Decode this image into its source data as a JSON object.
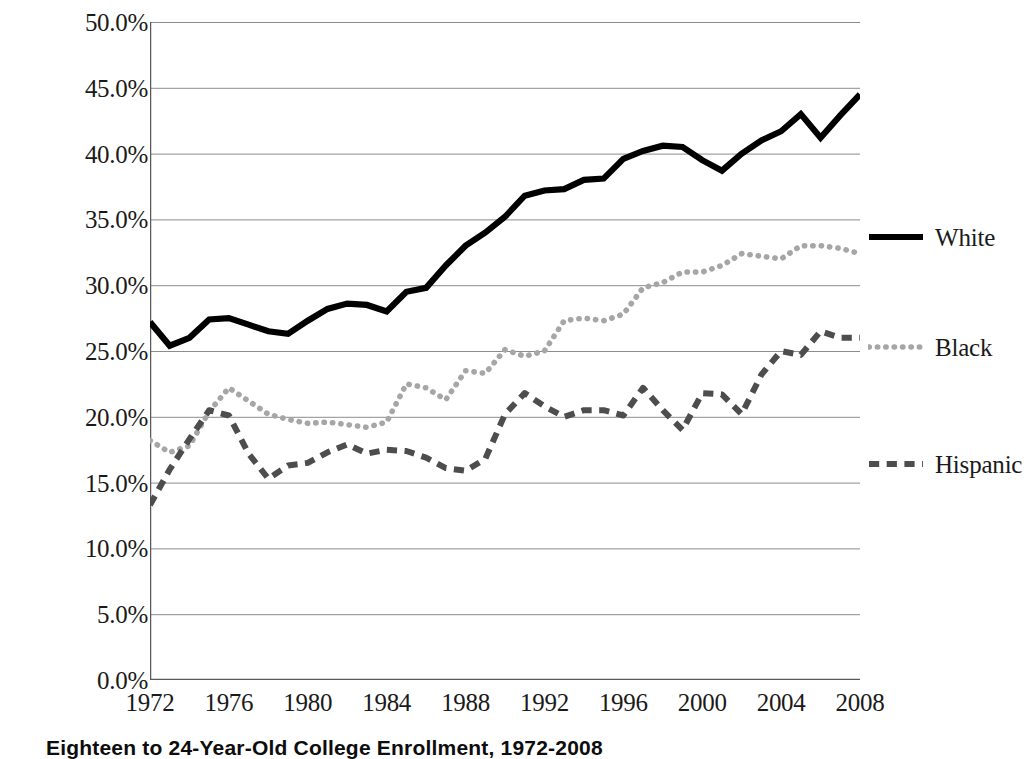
{
  "caption": "Eighteen to 24-Year-Old College Enrollment, 1972-2008",
  "colors": {
    "white_series": "#000000",
    "black_series": "#a6a6a6",
    "hispanic_series": "#4d4d4d",
    "gridline": "#8c8c8c",
    "axis": "#595959",
    "text": "#1a1a1a"
  },
  "legend": {
    "position": "right",
    "entries": [
      {
        "label": "White",
        "style": "solid",
        "color": "#000000",
        "swatch": "solid-line-swatch"
      },
      {
        "label": "Black",
        "style": "dotted",
        "color": "#a6a6a6",
        "swatch": "dotted-line-swatch"
      },
      {
        "label": "Hispanic",
        "style": "dashed",
        "color": "#4d4d4d",
        "swatch": "dashed-line-swatch"
      }
    ]
  },
  "chart_data": {
    "type": "line",
    "title": "Eighteen to 24-Year-Old College Enrollment, 1972-2008",
    "xlabel": "",
    "ylabel": "",
    "xlim": [
      1972,
      2008
    ],
    "ylim": [
      0,
      50
    ],
    "grid": true,
    "y_tick_labels": [
      "0.0%",
      "5.0%",
      "10.0%",
      "15.0%",
      "20.0%",
      "25.0%",
      "30.0%",
      "35.0%",
      "40.0%",
      "45.0%",
      "50.0%"
    ],
    "y_ticks": [
      0,
      5,
      10,
      15,
      20,
      25,
      30,
      35,
      40,
      45,
      50
    ],
    "x_tick_labels": [
      "1972",
      "1976",
      "1980",
      "1984",
      "1988",
      "1992",
      "1996",
      "2000",
      "2004",
      "2008"
    ],
    "x_ticks": [
      1972,
      1976,
      1980,
      1984,
      1988,
      1992,
      1996,
      2000,
      2004,
      2008
    ],
    "x_minor_tick_step": 1,
    "x": [
      1972,
      1973,
      1974,
      1975,
      1976,
      1977,
      1978,
      1979,
      1980,
      1981,
      1982,
      1983,
      1984,
      1985,
      1986,
      1987,
      1988,
      1989,
      1990,
      1991,
      1992,
      1993,
      1994,
      1995,
      1996,
      1997,
      1998,
      1999,
      2000,
      2001,
      2002,
      2003,
      2004,
      2005,
      2006,
      2007,
      2008
    ],
    "series": [
      {
        "name": "White",
        "style": "solid",
        "color": "#000000",
        "values": [
          27.2,
          25.4,
          26.0,
          27.4,
          27.5,
          27.0,
          26.5,
          26.3,
          27.3,
          28.2,
          28.6,
          28.5,
          28.0,
          29.5,
          29.8,
          31.5,
          33.0,
          34.0,
          35.2,
          36.8,
          37.2,
          37.3,
          38.0,
          38.1,
          39.6,
          40.2,
          40.6,
          40.5,
          39.5,
          38.7,
          40.0,
          41.0,
          41.7,
          43.0,
          41.2,
          42.9,
          44.5
        ]
      },
      {
        "name": "Black",
        "style": "dotted",
        "color": "#a6a6a6",
        "values": [
          18.2,
          17.3,
          17.8,
          20.4,
          22.2,
          21.2,
          20.2,
          19.8,
          19.5,
          19.6,
          19.4,
          19.2,
          19.6,
          22.5,
          22.2,
          21.3,
          23.5,
          23.3,
          25.1,
          24.6,
          25.0,
          27.3,
          27.5,
          27.3,
          27.8,
          29.8,
          30.2,
          31.0,
          31.0,
          31.5,
          32.4,
          32.2,
          32.0,
          33.0,
          33.0,
          32.8,
          32.4
        ]
      },
      {
        "name": "Hispanic",
        "style": "dashed",
        "color": "#4d4d4d",
        "values": [
          13.3,
          16.0,
          18.3,
          20.5,
          20.1,
          17.2,
          15.3,
          16.3,
          16.5,
          17.3,
          17.9,
          17.2,
          17.5,
          17.4,
          16.9,
          16.1,
          15.9,
          16.8,
          20.2,
          21.8,
          20.8,
          20.0,
          20.5,
          20.5,
          20.1,
          22.2,
          20.5,
          19.0,
          21.8,
          21.7,
          20.2,
          23.2,
          25.0,
          24.7,
          26.5,
          26.0,
          26.0
        ]
      }
    ]
  }
}
